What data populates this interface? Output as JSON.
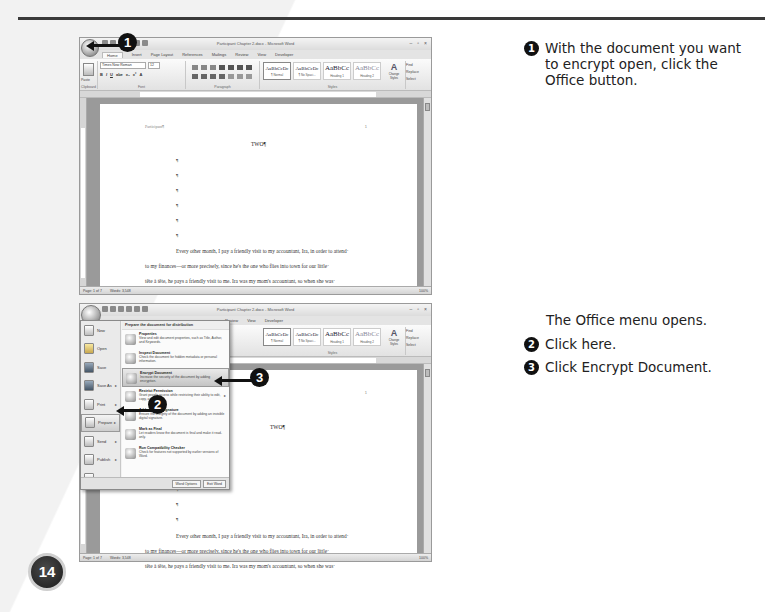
{
  "page": {
    "page_number": "14",
    "accent_color": "#111111"
  },
  "steps": [
    {
      "num": "1",
      "text": "With the document you want to encrypt open, click the Office button."
    },
    {
      "intro": "The Office menu opens."
    },
    {
      "num": "2",
      "text": "Click here."
    },
    {
      "num": "3",
      "text": "Click Encrypt Document."
    }
  ],
  "word": {
    "title": "Participant Chapter 2.docx - Microsoft Word",
    "tabs_full": [
      "Home",
      "Insert",
      "Page Layout",
      "References",
      "Mailings",
      "Review",
      "View",
      "Developer"
    ],
    "tabs_partial": [
      "Review",
      "View",
      "Developer"
    ],
    "font_name": "Times New Roman",
    "font_size": "12",
    "group_clipboard": "Clipboard",
    "group_font": "Font",
    "group_paragraph": "Paragraph",
    "group_styles": "Styles",
    "group_editing": "Editing",
    "paste_label": "Paste",
    "styles": [
      {
        "sample": "AaBbCcDc",
        "label": "¶ Normal"
      },
      {
        "sample": "AaBbCcDc",
        "label": "¶ No Spaci..."
      },
      {
        "sample": "AaBbCc",
        "label": "Heading 1"
      },
      {
        "sample": "AaBbCc",
        "label": "Heading 2"
      }
    ],
    "change_styles": "Change Styles",
    "editing": [
      "Find",
      "Replace",
      "Select"
    ],
    "status": {
      "page": "Page: 1 of 7",
      "words": "Words: 3,548",
      "zoom": "100%"
    },
    "doc": {
      "header": "Participant¶",
      "page_no": "1",
      "title": "TWO¶",
      "pilcrow": "¶",
      "lines": [
        "Every other month, I pay a friendly visit to my accountant, Ira, in order to attend·",
        "to my finances—or more precisely, since he's the one who flies into town for our little·",
        "tête à tête, he pays a friendly visit to me. Ira was my mom's accountant, so when she was·"
      ]
    },
    "office_menu": {
      "left_items": [
        "New",
        "Open",
        "Save",
        "Save As",
        "Print",
        "Prepare",
        "Send",
        "Publish",
        "Close"
      ],
      "right_header": "Prepare the document for distribution",
      "right_items": [
        {
          "title": "Properties",
          "desc": "View and edit document properties, such as Title, Author, and Keywords."
        },
        {
          "title": "Inspect Document",
          "desc": "Check the document for hidden metadata or personal information."
        },
        {
          "title": "Encrypt Document",
          "desc": "Increase the security of the document by adding encryption."
        },
        {
          "title": "Restrict Permission",
          "desc": "Grant people access while restricting their ability to edit, copy, and print."
        },
        {
          "title": "Add a Digital Signature",
          "desc": "Ensure the integrity of the document by adding an invisible digital signature."
        },
        {
          "title": "Mark as Final",
          "desc": "Let readers know the document is final and make it read-only."
        },
        {
          "title": "Run Compatibility Checker",
          "desc": "Check for features not supported by earlier versions of Word."
        }
      ],
      "word_options": "Word Options",
      "exit_word": "Exit Word"
    }
  },
  "callouts": [
    "1",
    "2",
    "3"
  ]
}
